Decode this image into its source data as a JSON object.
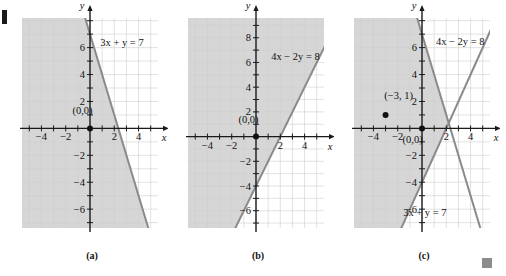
{
  "figure": {
    "width": 506,
    "height": 276,
    "background": "#ffffff",
    "line_color": "#8a8a8a",
    "axis_color": "#1a1a1a",
    "grid_color": "#cfcfcf",
    "shade_color": "#d6d6d6",
    "point_color": "#111111",
    "corner_mark": "figure-corner-mark",
    "end_mark": "section-end-square"
  },
  "chart_data": [
    {
      "type": "line",
      "id": "panel-a",
      "caption": "(a)",
      "title": "",
      "xlabel": "x",
      "ylabel": "y",
      "xlim": [
        -5.6,
        5.6
      ],
      "ylim": [
        -7.4,
        8.2
      ],
      "xticks": [
        -4,
        -2,
        2,
        4
      ],
      "yticks": [
        6,
        4,
        2,
        -2,
        -4,
        -6
      ],
      "xticklabels": [
        "-4",
        "-2",
        "2",
        "4"
      ],
      "yticklabels": [
        "6",
        "4",
        "2",
        "-2",
        "-4",
        "-6"
      ],
      "grid": true,
      "series": [
        {
          "name": "3x + y = 7",
          "label": "3x + y = 7",
          "label_x": 0.85,
          "label_y": 6.15,
          "slope": -3,
          "intercept": 7,
          "arrow_start": true,
          "arrow_end": true
        }
      ],
      "points": [
        {
          "label": "(0,0)",
          "x": 0,
          "y": 0,
          "label_dx": -1.45,
          "label_dy": 1.35
        }
      ],
      "shaded_region": {
        "description": "half-plane left of / below the line 3x + y = 7",
        "inequality": "3x + y < 7"
      }
    },
    {
      "type": "line",
      "id": "panel-b",
      "caption": "(b)",
      "title": "",
      "xlabel": "x",
      "ylabel": "y",
      "xlim": [
        -5.6,
        5.6
      ],
      "ylim": [
        -7.4,
        9.6
      ],
      "xticks": [
        -4,
        -2,
        2,
        4
      ],
      "yticks": [
        8,
        6,
        4,
        2,
        -2,
        -4,
        -6
      ],
      "xticklabels": [
        "-4",
        "-2",
        "2",
        "4"
      ],
      "yticklabels": [
        "8",
        "6",
        "4",
        "2",
        "-2",
        "-4",
        "-6"
      ],
      "grid": true,
      "series": [
        {
          "name": "4x - 2y = 8",
          "label": "4x − 2y = 8",
          "label_x": 1.25,
          "label_y": 6.2,
          "slope": 2,
          "intercept": -4,
          "arrow_start": true,
          "arrow_end": true
        }
      ],
      "points": [
        {
          "label": "(0,0)",
          "x": 0,
          "y": 0,
          "label_dx": -1.45,
          "label_dy": 1.35
        }
      ],
      "shaded_region": {
        "description": "half-plane above / left of the line 4x - 2y = 8",
        "inequality": "4x - 2y < 8"
      }
    },
    {
      "type": "line",
      "id": "panel-c",
      "caption": "(c)",
      "title": "",
      "xlabel": "x",
      "ylabel": "y",
      "xlim": [
        -5.6,
        5.6
      ],
      "ylim": [
        -7.4,
        8.2
      ],
      "xticks": [
        -4,
        -2,
        2,
        4
      ],
      "yticks": [
        6,
        4,
        2,
        -2,
        -4,
        -6
      ],
      "xticklabels": [
        "-4",
        "-2",
        "2",
        "4"
      ],
      "yticklabels": [
        "6",
        "4",
        "2",
        "-2",
        "-4",
        "-6"
      ],
      "grid": true,
      "series": [
        {
          "name": "4x - 2y = 8",
          "label": "4x − 2y = 8",
          "label_x": 1.15,
          "label_y": 6.2,
          "slope": 2,
          "intercept": -4,
          "arrow_start": true,
          "arrow_end": true
        },
        {
          "name": "3x + y = 7",
          "label": "3x + y = 7",
          "label_x": -1.55,
          "label_y": -6.5,
          "slope": -3,
          "intercept": 7,
          "arrow_start": true,
          "arrow_end": true
        }
      ],
      "points": [
        {
          "label": "(0,0)",
          "x": 0,
          "y": 0,
          "label_dx": -1.6,
          "label_dy": -0.85
        },
        {
          "label": "(−3, 1)",
          "x": -3,
          "y": 1,
          "label_dx": -0.1,
          "label_dy": 1.45
        }
      ],
      "intersection": {
        "x": 2,
        "y": 1
      },
      "shaded_region": {
        "description": "intersection half-plane: left of 3x + y = 7 and above 4x - 2y = 8",
        "inequality": "3x + y < 7 and 4x - 2y < 8"
      }
    }
  ]
}
